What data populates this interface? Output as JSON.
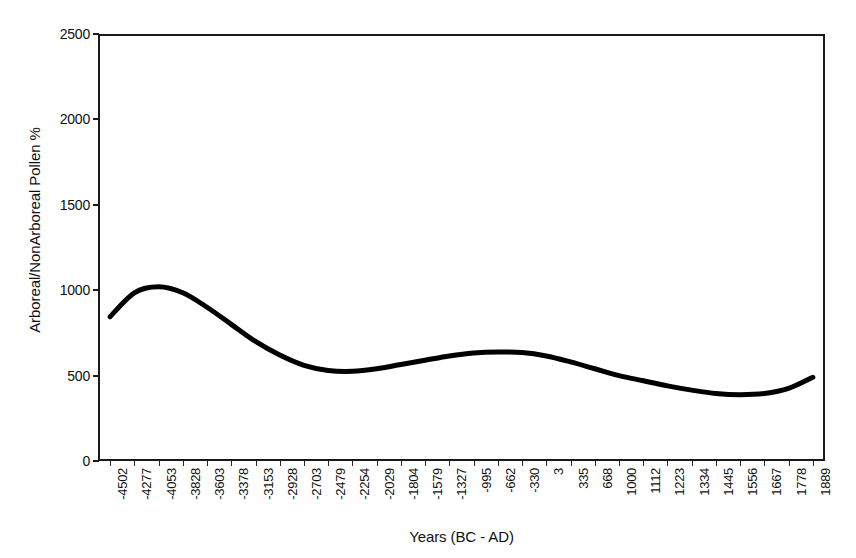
{
  "chart_data": {
    "type": "line",
    "title": "",
    "xlabel": "Years (BC - AD)",
    "ylabel": "Arboreal/NonArboreal Pollen %",
    "ylim": [
      0,
      2500
    ],
    "yticks": [
      0,
      500,
      1000,
      1500,
      2000,
      2500
    ],
    "grid": false,
    "legend": null,
    "categories": [
      "-4502",
      "-4277",
      "-4053",
      "-3828",
      "-3603",
      "-3378",
      "-3153",
      "-2928",
      "-2703",
      "-2479",
      "-2254",
      "-2029",
      "-1804",
      "-1579",
      "-1327",
      "-995",
      "-662",
      "-330",
      "3",
      "335",
      "668",
      "1000",
      "1112",
      "1223",
      "1334",
      "1445",
      "1556",
      "1667",
      "1778",
      "1889"
    ],
    "x": [
      -4502,
      -4277,
      -4053,
      -3828,
      -3603,
      -3378,
      -3153,
      -2928,
      -2703,
      -2479,
      -2254,
      -2029,
      -1804,
      -1579,
      -1327,
      -995,
      -662,
      -330,
      3,
      335,
      668,
      1000,
      1112,
      1223,
      1334,
      1445,
      1556,
      1667,
      1778,
      1889
    ],
    "series": [
      {
        "name": "Arboreal/NonArboreal Pollen %",
        "color": "#000000",
        "values": [
          845,
          985,
          1020,
          985,
          900,
          800,
          700,
          620,
          560,
          530,
          525,
          540,
          565,
          590,
          615,
          632,
          638,
          635,
          615,
          580,
          540,
          500,
          470,
          440,
          415,
          395,
          388,
          395,
          425,
          490
        ]
      }
    ]
  },
  "axes": {
    "y_tick_labels": [
      "2500",
      "2000",
      "1500",
      "1000",
      "500",
      "0"
    ],
    "y_title": "Arboreal/NonArboreal Pollen %",
    "x_title": "Years (BC - AD)",
    "x_tick_labels": [
      "-4502",
      "-4277",
      "-4053",
      "-3828",
      "-3603",
      "-3378",
      "-3153",
      "-2928",
      "-2703",
      "-2479",
      "-2254",
      "-2029",
      "-1804",
      "-1579",
      "-1327",
      "-995",
      "-662",
      "-330",
      "3",
      "335",
      "668",
      "1000",
      "1112",
      "1223",
      "1334",
      "1445",
      "1556",
      "1667",
      "1778",
      "1889"
    ]
  },
  "style": {
    "line_color": "#000000",
    "axis_color": "#1a1a1a",
    "background": "#ffffff"
  }
}
